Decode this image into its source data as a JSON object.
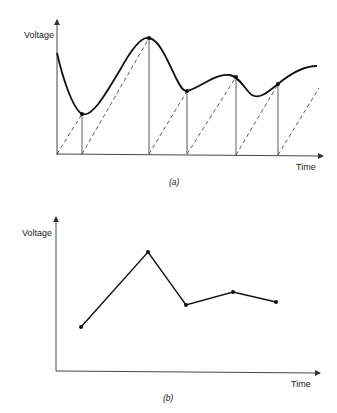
{
  "diagram_a": {
    "caption": "(a)",
    "y_axis_label": "Voltage",
    "x_axis_label": "Time",
    "description": "Continuous voltage waveform sampled at irregular times; dashed sawtooth ramps trigger each sample",
    "sample_points": [
      {
        "x": 82,
        "y": 114
      },
      {
        "x": 149,
        "y": 38
      },
      {
        "x": 187,
        "y": 91
      },
      {
        "x": 236,
        "y": 77
      },
      {
        "x": 278,
        "y": 84
      }
    ]
  },
  "diagram_b": {
    "caption": "(b)",
    "y_axis_label": "Voltage",
    "x_axis_label": "Time",
    "description": "Sampled points connected by straight line segments",
    "points": [
      {
        "x": 81,
        "y": 327
      },
      {
        "x": 148,
        "y": 252
      },
      {
        "x": 186,
        "y": 305
      },
      {
        "x": 233,
        "y": 292
      },
      {
        "x": 276,
        "y": 302
      }
    ]
  },
  "colors": {
    "ink": "#111111",
    "background": "#ffffff"
  }
}
